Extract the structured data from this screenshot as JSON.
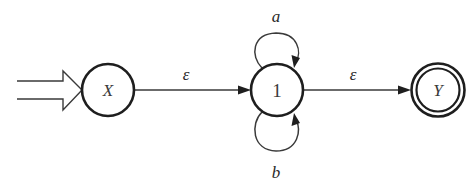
{
  "diagram": {
    "type": "finite-automaton",
    "colors": {
      "stroke": "#1e1e1e",
      "line": "#3a3a3a",
      "background": "#ffffff"
    },
    "states": [
      {
        "id": "X",
        "label": "X",
        "initial": true,
        "accepting": false
      },
      {
        "id": "1",
        "label": "1",
        "initial": false,
        "accepting": false
      },
      {
        "id": "Y",
        "label": "Y",
        "initial": false,
        "accepting": true
      }
    ],
    "transitions": [
      {
        "from": "X",
        "to": "1",
        "label": "ε"
      },
      {
        "from": "1",
        "to": "1",
        "label": "a",
        "position": "top-loop"
      },
      {
        "from": "1",
        "to": "1",
        "label": "b",
        "position": "bottom-loop"
      },
      {
        "from": "1",
        "to": "Y",
        "label": "ε"
      }
    ]
  }
}
